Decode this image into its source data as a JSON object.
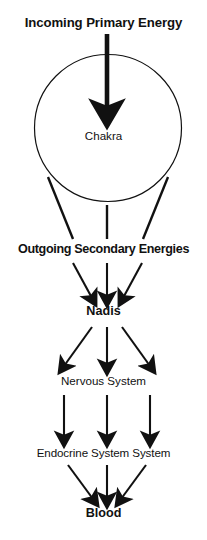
{
  "diagram": {
    "type": "flow-diagram",
    "title": "Incoming Primary Energy",
    "background_color": "#ffffff",
    "stroke_color": "#111111",
    "nodes": {
      "incoming": "Incoming Primary Energy",
      "chakra": "Chakra",
      "outgoing": "Outgoing Secondary Energies",
      "nadis": "Nadis",
      "nervous": "Nervous System",
      "endocrine": "Endocrine System System",
      "blood": "Blood"
    }
  }
}
